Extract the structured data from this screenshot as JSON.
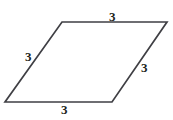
{
  "figure": {
    "name": "rhombus",
    "stroke_color": "#3f3f44",
    "fill_color": "#ffffff",
    "stroke_width": 1.7,
    "background_color": "#ffffff",
    "vertices": {
      "top_left": {
        "x": 62,
        "y": 22
      },
      "top_right": {
        "x": 167,
        "y": 22
      },
      "bottom_right": {
        "x": 112,
        "y": 102
      },
      "bottom_left": {
        "x": 5,
        "y": 102
      }
    },
    "labels": {
      "top": "3",
      "left": "3",
      "right": "3",
      "bottom": "3"
    },
    "label_color": "#231f20"
  },
  "chart_data": {
    "type": "diagram",
    "shape": "rhombus",
    "side_lengths": [
      3,
      3,
      3,
      3
    ],
    "side_names": [
      "top",
      "right",
      "bottom",
      "left"
    ],
    "units": "",
    "title": "",
    "annotations": [
      "3",
      "3",
      "3",
      "3"
    ]
  }
}
